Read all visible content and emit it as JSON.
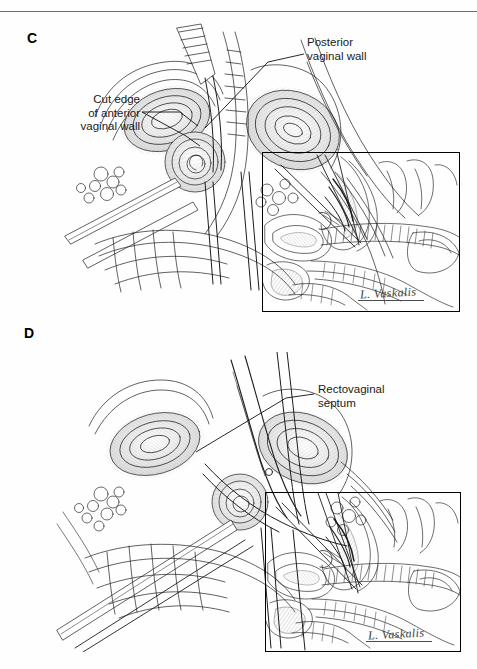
{
  "page": {
    "background_color": "#ffffff",
    "ink_color": "#1a1a1a",
    "running_head_fragment": "",
    "width": 477,
    "height": 669
  },
  "panels": [
    {
      "id": "C",
      "letter": "C",
      "description": "Surgical pen-and-ink illustration: vaginal dissection with retractors and forceps exposing cut edge of anterior vaginal wall",
      "labels": [
        {
          "name": "cut-edge-of-anterior-vaginal-wall",
          "text": "Cut edge\nof anterior\nvaginal wall",
          "align": "right"
        },
        {
          "name": "posterior-vaginal-wall",
          "text": "Posterior\nvaginal wall",
          "align": "left"
        }
      ],
      "inset": {
        "name": "sagittal-cross-section-inset",
        "description": "Sagittal midline cross-section showing bladder, vagina, rectum and instruments"
      },
      "signature": "L. Vaskalis"
    },
    {
      "id": "D",
      "letter": "D",
      "description": "Surgical pen-and-ink illustration: scissors dividing the rectovaginal septum",
      "labels": [
        {
          "name": "rectovaginal-septum",
          "text": "Rectovaginal\nseptum",
          "align": "left"
        }
      ],
      "inset": {
        "name": "sagittal-cross-section-inset",
        "description": "Sagittal midline cross-section showing rectovaginal septum dissection plane"
      },
      "signature": "L. Vaskalis"
    }
  ],
  "labels": {
    "letter_c": "C",
    "letter_d": "D",
    "cut_edge": "Cut edge\nof anterior\nvaginal wall",
    "posterior": "Posterior\nvaginal wall",
    "rectovaginal": "Rectovaginal\nseptum",
    "signature_c": "L. Vaskalis",
    "signature_d": "L. Vaskalis"
  }
}
